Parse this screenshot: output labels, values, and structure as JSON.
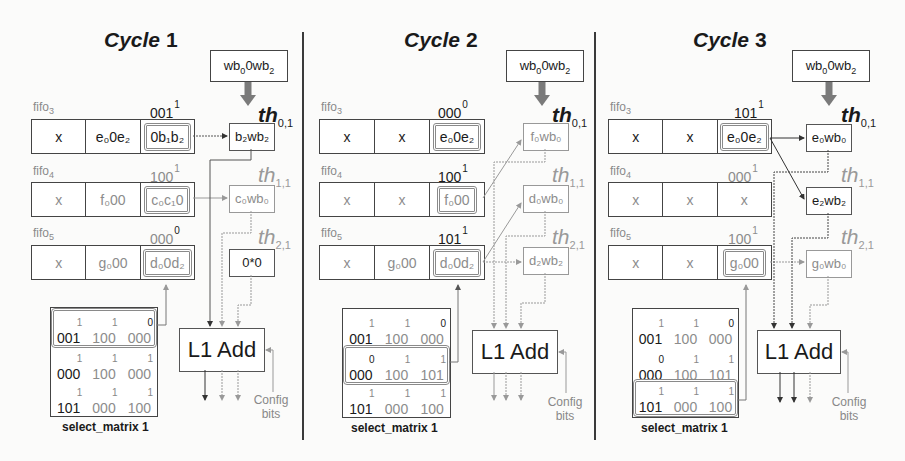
{
  "cycles": [
    {
      "title_word": "Cycle",
      "title_num": "1",
      "weight_box": {
        "base": "wb",
        "sub0": "0",
        "mid": "0wb",
        "sub2": "2"
      },
      "fifos": [
        {
          "label": "fifo",
          "label_sub": "3",
          "select": "001",
          "select_sup": "1",
          "cells": [
            {
              "text": "x",
              "state": "active"
            },
            {
              "text": "e₀0e₂",
              "state": "active"
            },
            {
              "text": "0b₁b₂",
              "state": "active",
              "highlight": true
            }
          ]
        },
        {
          "label": "fifo",
          "label_sub": "4",
          "select": "100",
          "select_sup": "1",
          "cells": [
            {
              "text": "x",
              "state": "inactive"
            },
            {
              "text": "f₀00",
              "state": "inactive"
            },
            {
              "text": "c₀c₁0",
              "state": "inactive",
              "highlight": true
            }
          ]
        },
        {
          "label": "fifo",
          "label_sub": "5",
          "select": "000",
          "select_sup": "0",
          "cells": [
            {
              "text": "x",
              "state": "inactive"
            },
            {
              "text": "g₀00",
              "state": "inactive"
            },
            {
              "text": "d₀0d₂",
              "state": "inactive",
              "highlight": true
            }
          ]
        }
      ],
      "threads": [
        {
          "label": "th",
          "sub": "0,1",
          "output": "b₂wb₂",
          "state": "active"
        },
        {
          "label": "th",
          "sub": "1,1",
          "output": "c₀wb₀",
          "state": "inactive"
        },
        {
          "label": "th",
          "sub": "2,1",
          "output": "0*0",
          "state": "active"
        }
      ],
      "adder_label": "L1 Add",
      "config_label_1": "Config",
      "config_label_2": "bits",
      "matrix": {
        "caption": "select_matrix 1",
        "highlight_row": 0,
        "rows": [
          [
            {
              "v": "001",
              "s": "1"
            },
            {
              "v": "100",
              "s": "1"
            },
            {
              "v": "000",
              "s": "0"
            }
          ],
          [
            {
              "v": "000",
              "s": "1"
            },
            {
              "v": "100",
              "s": "1"
            },
            {
              "v": "000",
              "s": "1"
            }
          ],
          [
            {
              "v": "101",
              "s": "1"
            },
            {
              "v": "000",
              "s": "1"
            },
            {
              "v": "100",
              "s": "1"
            }
          ]
        ]
      }
    },
    {
      "title_word": "Cycle",
      "title_num": "2",
      "weight_box": {
        "base": "wb",
        "sub0": "0",
        "mid": "0wb",
        "sub2": "2"
      },
      "fifos": [
        {
          "label": "fifo",
          "label_sub": "3",
          "select": "000",
          "select_sup": "0",
          "cells": [
            {
              "text": "x",
              "state": "active"
            },
            {
              "text": "x",
              "state": "active"
            },
            {
              "text": "e₀0e₂",
              "state": "active",
              "highlight": true
            }
          ]
        },
        {
          "label": "fifo",
          "label_sub": "4",
          "select": "100",
          "select_sup": "1",
          "cells": [
            {
              "text": "x",
              "state": "inactive"
            },
            {
              "text": "x",
              "state": "inactive"
            },
            {
              "text": "f₀00",
              "state": "inactive",
              "highlight": true
            }
          ]
        },
        {
          "label": "fifo",
          "label_sub": "5",
          "select": "101",
          "select_sup": "1",
          "cells": [
            {
              "text": "x",
              "state": "inactive"
            },
            {
              "text": "g₀00",
              "state": "inactive"
            },
            {
              "text": "d₀0d₂",
              "state": "inactive",
              "highlight": true
            }
          ]
        }
      ],
      "threads": [
        {
          "label": "th",
          "sub": "0,1",
          "output": "f₀wb₀",
          "state": "inactive"
        },
        {
          "label": "th",
          "sub": "1,1",
          "output": "d₀wb₀",
          "state": "inactive"
        },
        {
          "label": "th",
          "sub": "2,1",
          "output": "d₂wb₂",
          "state": "inactive"
        }
      ],
      "adder_label": "L1 Add",
      "config_label_1": "Config",
      "config_label_2": "bits",
      "matrix": {
        "caption": "select_matrix 1",
        "highlight_row": 1,
        "rows": [
          [
            {
              "v": "001",
              "s": "1"
            },
            {
              "v": "100",
              "s": "1"
            },
            {
              "v": "000",
              "s": "0"
            }
          ],
          [
            {
              "v": "000",
              "s": "0"
            },
            {
              "v": "100",
              "s": "1"
            },
            {
              "v": "101",
              "s": "1"
            }
          ],
          [
            {
              "v": "101",
              "s": "1"
            },
            {
              "v": "000",
              "s": "1"
            },
            {
              "v": "100",
              "s": "1"
            }
          ]
        ]
      }
    },
    {
      "title_word": "Cycle",
      "title_num": "3",
      "weight_box": {
        "base": "wb",
        "sub0": "0",
        "mid": "0wb",
        "sub2": "2"
      },
      "fifos": [
        {
          "label": "fifo",
          "label_sub": "3",
          "select": "101",
          "select_sup": "1",
          "cells": [
            {
              "text": "x",
              "state": "active"
            },
            {
              "text": "x",
              "state": "active"
            },
            {
              "text": "e₀0e₂",
              "state": "active",
              "highlight": true
            }
          ]
        },
        {
          "label": "fifo",
          "label_sub": "4",
          "select": "000",
          "select_sup": "1",
          "cells": [
            {
              "text": "x",
              "state": "inactive"
            },
            {
              "text": "x",
              "state": "inactive"
            },
            {
              "text": "x",
              "state": "inactive"
            }
          ]
        },
        {
          "label": "fifo",
          "label_sub": "5",
          "select": "100",
          "select_sup": "1",
          "cells": [
            {
              "text": "x",
              "state": "inactive"
            },
            {
              "text": "x",
              "state": "inactive"
            },
            {
              "text": "g₀00",
              "state": "inactive",
              "highlight": true
            }
          ]
        }
      ],
      "threads": [
        {
          "label": "th",
          "sub": "0,1",
          "output": "e₀wb₀",
          "state": "active"
        },
        {
          "label": "th",
          "sub": "1,1",
          "output": "e₂wb₂",
          "state": "active"
        },
        {
          "label": "th",
          "sub": "2,1",
          "output": "g₀wb₀",
          "state": "inactive"
        }
      ],
      "adder_label": "L1 Add",
      "config_label_1": "Config",
      "config_label_2": "bits",
      "matrix": {
        "caption": "select_matrix 1",
        "highlight_row": 2,
        "rows": [
          [
            {
              "v": "001",
              "s": "1"
            },
            {
              "v": "100",
              "s": "1"
            },
            {
              "v": "000",
              "s": "0"
            }
          ],
          [
            {
              "v": "000",
              "s": "0"
            },
            {
              "v": "100",
              "s": "1"
            },
            {
              "v": "101",
              "s": "1"
            }
          ],
          [
            {
              "v": "101",
              "s": "1"
            },
            {
              "v": "000",
              "s": "1"
            },
            {
              "v": "100",
              "s": "1"
            }
          ]
        ]
      }
    }
  ],
  "colors": {
    "active": "#1a1a1a",
    "inactive": "#8c8c8c",
    "highlight_border": "#8a8a8a",
    "weight_arrow": "#7a7a7a"
  }
}
